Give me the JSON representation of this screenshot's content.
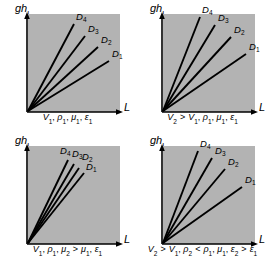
{
  "figure": {
    "background_color": "#ffffff",
    "plot_fill_color": "#b3b3b3",
    "line_color": "#000000",
    "axis_color": "#000000"
  },
  "axes": {
    "y_label": "gh",
    "y_label_sub": "L",
    "x_label": "L"
  },
  "curve_labels": {
    "d1": "D",
    "d1_sub": "1",
    "d2": "D",
    "d2_sub": "2",
    "d3": "D",
    "d3_sub": "3",
    "d4": "D",
    "d4_sub": "4"
  },
  "panels": [
    {
      "id": "panel-top-left",
      "position": "top-left",
      "caption_parts": [
        {
          "t": "V",
          "s": "1",
          "style": "italic"
        },
        {
          "t": ", ",
          "style": "plain"
        },
        {
          "t": "ρ",
          "s": "1",
          "style": "italic"
        },
        {
          "t": ", ",
          "style": "plain"
        },
        {
          "t": "μ",
          "s": "1",
          "style": "italic"
        },
        {
          "t": ", ",
          "style": "plain"
        },
        {
          "t": "ε",
          "s": "1",
          "style": "italic"
        }
      ],
      "caption_text": "V1, ρ1, μ1, ε1"
    },
    {
      "id": "panel-top-right",
      "position": "top-right",
      "caption_parts": [
        {
          "t": "V",
          "s": "2",
          "style": "italic"
        },
        {
          "t": " > ",
          "style": "rel"
        },
        {
          "t": "V",
          "s": "1",
          "style": "italic"
        },
        {
          "t": ", ",
          "style": "plain"
        },
        {
          "t": "ρ",
          "s": "1",
          "style": "italic"
        },
        {
          "t": ", ",
          "style": "plain"
        },
        {
          "t": "μ",
          "s": "1",
          "style": "italic"
        },
        {
          "t": ", ",
          "style": "plain"
        },
        {
          "t": "ε",
          "s": "1",
          "style": "italic"
        }
      ],
      "caption_text": "V2 > V1, ρ1, μ1, ε1"
    },
    {
      "id": "panel-bottom-left",
      "position": "bottom-left",
      "caption_parts": [
        {
          "t": "V",
          "s": "1",
          "style": "italic"
        },
        {
          "t": ", ",
          "style": "plain"
        },
        {
          "t": "ρ",
          "s": "1",
          "style": "italic"
        },
        {
          "t": ", ",
          "style": "plain"
        },
        {
          "t": "μ",
          "s": "2",
          "style": "italic"
        },
        {
          "t": " > ",
          "style": "rel"
        },
        {
          "t": "μ",
          "s": "1",
          "style": "italic"
        },
        {
          "t": ", ",
          "style": "plain"
        },
        {
          "t": "ε",
          "s": "1",
          "style": "italic"
        }
      ],
      "caption_text": "V1, ρ1, μ2 > μ1, ε1"
    },
    {
      "id": "panel-bottom-right",
      "position": "bottom-right",
      "caption_parts": [
        {
          "t": "V",
          "s": "2",
          "style": "italic"
        },
        {
          "t": " > ",
          "style": "rel"
        },
        {
          "t": "V",
          "s": "1",
          "style": "italic"
        },
        {
          "t": ", ",
          "style": "plain"
        },
        {
          "t": "ρ",
          "s": "2",
          "style": "italic"
        },
        {
          "t": " < ",
          "style": "rel"
        },
        {
          "t": "ρ",
          "s": "1",
          "style": "italic"
        },
        {
          "t": ", ",
          "style": "plain"
        },
        {
          "t": "μ",
          "s": "1",
          "style": "italic"
        },
        {
          "t": ", ",
          "style": "plain"
        },
        {
          "t": "ε",
          "s": "2",
          "style": "italic"
        },
        {
          "t": " > ",
          "style": "rel"
        },
        {
          "t": "ε",
          "s": "1",
          "style": "italic"
        }
      ],
      "caption_text": "V2 > V1, ρ2 < ρ1, μ1, ε2 > ε1"
    }
  ],
  "chart_data": {
    "type": "line",
    "xlabel": "L",
    "ylabel": "gh_L",
    "grid": false,
    "legend": "inline-end-labels",
    "axis_ranges": {
      "x": [
        0,
        1
      ],
      "y": [
        0,
        1
      ]
    },
    "note": "All lines are straight and pass through the origin; only slope varies. Slope increases as diameter decreases (D1 smallest slope, D4 largest).",
    "panels": [
      {
        "id": "panel-top-left",
        "caption": "V1, ρ1, μ1, ε1",
        "series": [
          {
            "name": "D1",
            "slope": 0.62,
            "endpoint": [
              0.88,
              0.55
            ]
          },
          {
            "name": "D2",
            "slope": 0.92,
            "endpoint": [
              0.76,
              0.7
            ]
          },
          {
            "name": "D3",
            "slope": 1.32,
            "endpoint": [
              0.62,
              0.82
            ]
          },
          {
            "name": "D4",
            "slope": 1.88,
            "endpoint": [
              0.5,
              0.94
            ]
          }
        ]
      },
      {
        "id": "panel-top-right",
        "caption": "V2 > V1, ρ1, μ1, ε1",
        "series": [
          {
            "name": "D1",
            "slope": 0.7,
            "endpoint": [
              0.9,
              0.63
            ]
          },
          {
            "name": "D2",
            "slope": 1.1,
            "endpoint": [
              0.74,
              0.81
            ]
          },
          {
            "name": "D3",
            "slope": 1.7,
            "endpoint": [
              0.56,
              0.95
            ]
          },
          {
            "name": "D4",
            "slope": 2.55,
            "endpoint": [
              0.4,
              1.02
            ]
          }
        ]
      },
      {
        "id": "panel-bottom-left",
        "caption": "V1, ρ1, μ2 > μ1, ε1",
        "series": [
          {
            "name": "D1",
            "slope": 1.62,
            "endpoint": [
              0.52,
              0.84
            ]
          },
          {
            "name": "D2",
            "slope": 1.9,
            "endpoint": [
              0.46,
              0.87
            ]
          },
          {
            "name": "D3",
            "slope": 2.22,
            "endpoint": [
              0.4,
              0.89
            ]
          },
          {
            "name": "D4",
            "slope": 2.62,
            "endpoint": [
              0.35,
              0.92
            ]
          }
        ]
      },
      {
        "id": "panel-bottom-right",
        "caption": "V2 > V1, ρ2 < ρ1, μ1, ε2 > ε1",
        "series": [
          {
            "name": "D1",
            "slope": 0.72,
            "endpoint": [
              0.86,
              0.62
            ]
          },
          {
            "name": "D2",
            "slope": 1.2,
            "endpoint": [
              0.68,
              0.82
            ]
          },
          {
            "name": "D3",
            "slope": 1.75,
            "endpoint": [
              0.53,
              0.93
            ]
          },
          {
            "name": "D4",
            "slope": 2.5,
            "endpoint": [
              0.4,
              1.0
            ]
          }
        ]
      }
    ]
  }
}
